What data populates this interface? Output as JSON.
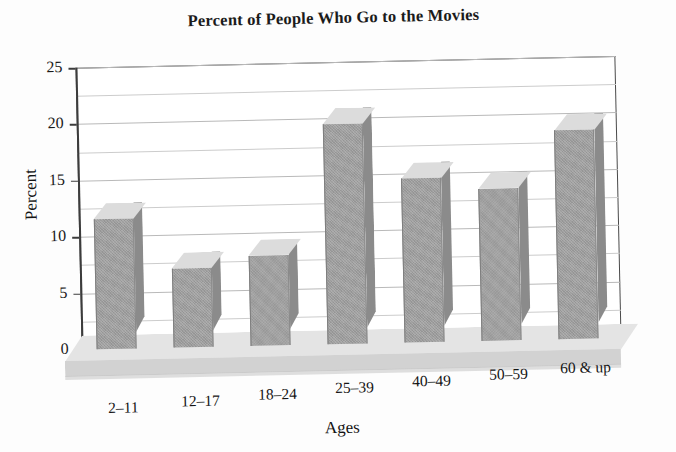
{
  "chart_data": {
    "type": "bar",
    "title": "Percent of People Who Go to the Movies",
    "xlabel": "Ages",
    "ylabel": "Percent",
    "categories": [
      "2–11",
      "12–17",
      "18–24",
      "25–39",
      "40–49",
      "50–59",
      "60 & up"
    ],
    "values": [
      11.5,
      7,
      8,
      19.5,
      14.5,
      13.5,
      18.5
    ],
    "ylim": [
      0,
      25
    ],
    "y_ticks": [
      0,
      5,
      10,
      15,
      20,
      25
    ],
    "y_tick_labels": [
      "0",
      "5",
      "10",
      "15",
      "20",
      "25"
    ],
    "y_minor_ticks": [
      2.5,
      7.5,
      12.5,
      17.5,
      22.5
    ],
    "grid": true,
    "legend": "none",
    "style": "3d-bar",
    "colors": {
      "bar_front": "#9d9d9d",
      "bar_top": "#dcdcdc",
      "bar_side": "#8b8b8b",
      "gridline": "#b9b9b9",
      "axis": "#3c3c3c",
      "base_top": "#e4e4e4",
      "base_front": "#d2d2d2",
      "background": "#ffffff",
      "text": "#151515"
    }
  }
}
